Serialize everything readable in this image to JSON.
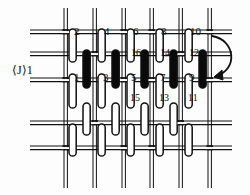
{
  "figure": {
    "type": "woven-fabric-cross-section",
    "background_color": "#fdfdfd",
    "ink_color": "#111111",
    "fill_white": "#ffffff",
    "fill_black": "#0a0a0a"
  },
  "axis_label": {
    "text": "⟨J⟩1",
    "name": "direction-label"
  },
  "rotation_arrow": {
    "name": "rotation-arrow",
    "direction": "clockwise-down-left"
  },
  "labels": {
    "top_row": [
      {
        "text": "2",
        "x": 74,
        "y": 26
      },
      {
        "text": "4",
        "x": 104,
        "y": 26
      },
      {
        "text": "6",
        "x": 133,
        "y": 26
      },
      {
        "text": "8",
        "x": 161,
        "y": 26
      },
      {
        "text": "10",
        "x": 190,
        "y": 26
      }
    ],
    "black_row": [
      {
        "text": "16",
        "x": 131,
        "y": 48
      },
      {
        "text": "14",
        "x": 160,
        "y": 48
      },
      {
        "text": "12",
        "x": 189,
        "y": 48
      }
    ],
    "mid_row": [
      {
        "text": "1",
        "x": 74,
        "y": 72
      },
      {
        "text": "3",
        "x": 103,
        "y": 72
      },
      {
        "text": "5",
        "x": 131,
        "y": 72
      },
      {
        "text": "7",
        "x": 160,
        "y": 72
      },
      {
        "text": "9",
        "x": 189,
        "y": 72
      }
    ],
    "low_row": [
      {
        "text": "15",
        "x": 130,
        "y": 93
      },
      {
        "text": "13",
        "x": 159,
        "y": 93
      },
      {
        "text": "11",
        "x": 188,
        "y": 93
      }
    ]
  },
  "grid": {
    "horizontal_lines_y": [
      30,
      52,
      78,
      121,
      146
    ],
    "vertical_lines_x": [
      64,
      93,
      122,
      150,
      179,
      208
    ]
  },
  "capsules": {
    "white_top": [
      {
        "x": 69,
        "y": 29,
        "h": 33
      },
      {
        "x": 98,
        "y": 29,
        "h": 33
      },
      {
        "x": 127,
        "y": 29,
        "h": 33
      },
      {
        "x": 156,
        "y": 29,
        "h": 33
      },
      {
        "x": 185,
        "y": 29,
        "h": 33
      }
    ],
    "black": [
      {
        "x": 83,
        "y": 50,
        "h": 38
      },
      {
        "x": 112,
        "y": 50,
        "h": 38
      },
      {
        "x": 141,
        "y": 50,
        "h": 38
      },
      {
        "x": 170,
        "y": 50,
        "h": 38
      },
      {
        "x": 199,
        "y": 50,
        "h": 38
      }
    ],
    "white_mid": [
      {
        "x": 69,
        "y": 74,
        "h": 34
      },
      {
        "x": 98,
        "y": 74,
        "h": 34
      },
      {
        "x": 127,
        "y": 74,
        "h": 34
      },
      {
        "x": 156,
        "y": 74,
        "h": 34
      },
      {
        "x": 185,
        "y": 74,
        "h": 34
      }
    ],
    "white_row3": [
      {
        "x": 83,
        "y": 103,
        "h": 32
      },
      {
        "x": 112,
        "y": 103,
        "h": 32
      },
      {
        "x": 141,
        "y": 103,
        "h": 32
      },
      {
        "x": 170,
        "y": 103,
        "h": 32
      }
    ],
    "white_row4": [
      {
        "x": 69,
        "y": 124,
        "h": 32
      },
      {
        "x": 98,
        "y": 124,
        "h": 32
      },
      {
        "x": 127,
        "y": 124,
        "h": 32
      },
      {
        "x": 156,
        "y": 124,
        "h": 32
      },
      {
        "x": 185,
        "y": 124,
        "h": 32
      }
    ]
  }
}
